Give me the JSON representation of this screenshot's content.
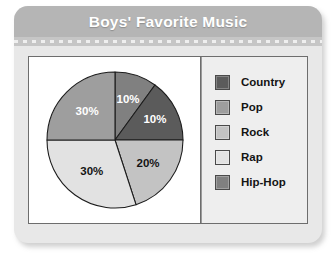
{
  "card": {
    "title": "Boys' Favorite Music"
  },
  "chart_data": {
    "type": "pie",
    "title": "Boys' Favorite Music",
    "categories": [
      "Country",
      "Pop",
      "Rock",
      "Rap",
      "Hip-Hop"
    ],
    "values": [
      10,
      30,
      20,
      30,
      10
    ],
    "value_labels": [
      "10%",
      "30%",
      "20%",
      "30%",
      "10%"
    ],
    "unit": "percent",
    "total": 100,
    "legend_position": "right",
    "grid": false,
    "slice_order_clockwise_from_top": [
      "Hip-Hop",
      "Country",
      "Rock",
      "Rap",
      "Pop"
    ],
    "colors": {
      "Country": "#5b5b5b",
      "Pop": "#9e9e9e",
      "Rock": "#c3c3c3",
      "Rap": "#e2e2e2",
      "Hip-Hop": "#808080"
    },
    "slices": [
      {
        "label": "Hip-Hop",
        "value": 10,
        "display": "10%",
        "color": "#808080",
        "start_deg": 0,
        "end_deg": 36,
        "label_color": "#ffffff",
        "label_r": 0.62
      },
      {
        "label": "Country",
        "value": 10,
        "display": "10%",
        "color": "#5b5b5b",
        "start_deg": 36,
        "end_deg": 90,
        "label_color": "#ffffff",
        "label_r": 0.66
      },
      {
        "label": "Rock",
        "value": 20,
        "display": "20%",
        "color": "#c3c3c3",
        "start_deg": 90,
        "end_deg": 162,
        "label_color": "#141414",
        "label_r": 0.6
      },
      {
        "label": "Rap",
        "value": 30,
        "display": "30%",
        "color": "#e2e2e2",
        "start_deg": 162,
        "end_deg": 270,
        "label_color": "#141414",
        "label_r": 0.58
      },
      {
        "label": "Pop",
        "value": 30,
        "display": "30%",
        "color": "#9e9e9e",
        "start_deg": 270,
        "end_deg": 360,
        "label_color": "#ffffff",
        "label_r": 0.58
      }
    ]
  },
  "legend": {
    "items": [
      {
        "label": "Country",
        "color": "#5b5b5b"
      },
      {
        "label": "Pop",
        "color": "#9e9e9e"
      },
      {
        "label": "Rock",
        "color": "#c3c3c3"
      },
      {
        "label": "Rap",
        "color": "#e2e2e2"
      },
      {
        "label": "Hip-Hop",
        "color": "#808080"
      }
    ]
  }
}
